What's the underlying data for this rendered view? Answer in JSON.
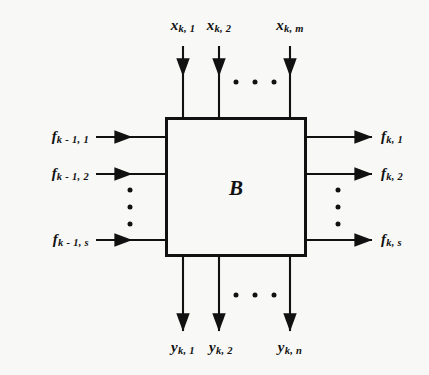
{
  "figure": {
    "type": "block-diagram",
    "title": "",
    "block": {
      "label": "B",
      "shape": "rectangle"
    },
    "inputs_top": {
      "direction": "down-into-block",
      "labels": [
        "x",
        "x",
        "x"
      ],
      "items": [
        {
          "base": "x",
          "sub": "k, 1",
          "x": 183
        },
        {
          "base": "x",
          "sub": "k, 2",
          "x": 219
        },
        {
          "base": "x",
          "sub": "k, m",
          "x": 290
        }
      ],
      "ellipsis": "horizontal"
    },
    "inputs_left": {
      "direction": "right-into-block",
      "items": [
        {
          "base": "f",
          "sub": "k - 1, 1",
          "y": 137
        },
        {
          "base": "f",
          "sub": "k - 1, 2",
          "y": 174
        },
        {
          "base": "f",
          "sub": "k - 1, s",
          "y": 240
        }
      ],
      "ellipsis": "vertical"
    },
    "outputs_right": {
      "direction": "right-out-of-block",
      "items": [
        {
          "base": "f",
          "sub": "k, 1",
          "y": 137
        },
        {
          "base": "f",
          "sub": "k, 2",
          "y": 174
        },
        {
          "base": "f",
          "sub": "k, s",
          "y": 240
        }
      ],
      "ellipsis": "vertical"
    },
    "outputs_bottom": {
      "direction": "down-out-of-block",
      "items": [
        {
          "base": "y",
          "sub": "k, 1",
          "x": 183
        },
        {
          "base": "y",
          "sub": "k, 2",
          "x": 219
        },
        {
          "base": "y",
          "sub": "k, n",
          "x": 290
        }
      ],
      "ellipsis": "horizontal"
    },
    "colors": {
      "stroke": "#111111",
      "background": "#f8f8f6",
      "box_fill": "#f8f8f6"
    }
  },
  "labels": {
    "top_1": "x",
    "top_1_sub": "k, 1",
    "top_2": "x",
    "top_2_sub": "k, 2",
    "top_3": "x",
    "top_3_sub": "k, m",
    "left_1": "f",
    "left_1_sub": "k - 1, 1",
    "left_2": "f",
    "left_2_sub": "k - 1, 2",
    "left_3": "f",
    "left_3_sub": "k - 1, s",
    "right_1": "f",
    "right_1_sub": "k, 1",
    "right_2": "f",
    "right_2_sub": "k, 2",
    "right_3": "f",
    "right_3_sub": "k, s",
    "bottom_1": "y",
    "bottom_1_sub": "k, 1",
    "bottom_2": "y",
    "bottom_2_sub": "k, 2",
    "bottom_3": "y",
    "bottom_3_sub": "k, n",
    "block": "B"
  }
}
